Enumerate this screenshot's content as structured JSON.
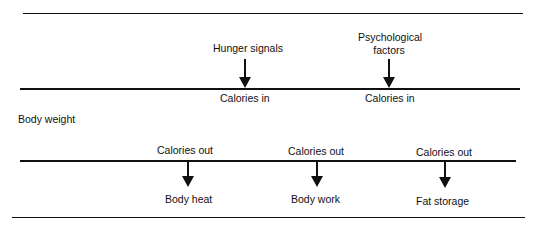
{
  "diagram": {
    "side_label": "Body weight",
    "inputs": [
      {
        "source": "Hunger signals",
        "target": "Calories in"
      },
      {
        "source_line1": "Psychological",
        "source_line2": "factors",
        "target": "Calories in"
      }
    ],
    "outputs": [
      {
        "source": "Calories out",
        "target": "Body heat"
      },
      {
        "source": "Calories out",
        "target": "Body work"
      },
      {
        "source": "Calories out",
        "target": "Fat storage"
      }
    ]
  }
}
